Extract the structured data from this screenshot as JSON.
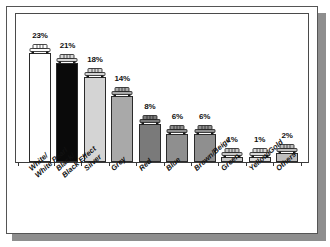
{
  "chart_data": {
    "type": "bar",
    "title": "",
    "subtitle": "",
    "xlabel": "",
    "ylabel": "",
    "ylim": [
      0,
      25
    ],
    "grid": false,
    "legend": "none",
    "categories": [
      "White/White Pearl",
      "Black/Black Effect",
      "Silver",
      "Grey",
      "Red",
      "Blue",
      "Brown/Beige",
      "Green",
      "Yellow/Gold",
      "Others"
    ],
    "category_lines": [
      [
        "White/",
        "White Pearl"
      ],
      [
        "Black/",
        "Black Effect"
      ],
      [
        "Silver",
        ""
      ],
      [
        "Grey",
        ""
      ],
      [
        "Red",
        ""
      ],
      [
        "Blue",
        ""
      ],
      [
        "Brown/Beige",
        ""
      ],
      [
        "Green",
        ""
      ],
      [
        "Yellow/Gold",
        ""
      ],
      [
        "Others",
        ""
      ]
    ],
    "values": [
      23,
      21,
      18,
      14,
      8,
      6,
      6,
      1,
      1,
      2
    ],
    "data_labels": [
      "23%",
      "21%",
      "18%",
      "14%",
      "8%",
      "6%",
      "6%",
      "1%",
      "1%",
      "2%"
    ],
    "bar_colors": [
      "#ffffff",
      "#0a0a0a",
      "#d4d4d4",
      "#a9a9a9",
      "#7a7a7a",
      "#8f8f8f",
      "#8f8f8f",
      "#c6c6c6",
      "#d9d9d9",
      "#bdbdbd"
    ],
    "annotations": [
      {
        "name": "car-icon",
        "description": "car front pictogram above each bar"
      }
    ]
  },
  "figure": {
    "frame_color": "#555555",
    "axis_color": "#3a3a3a",
    "shadow_color": "#8e8e8e",
    "background": "#ffffff"
  },
  "icons": {
    "bar_icon_name": "car-icon"
  }
}
